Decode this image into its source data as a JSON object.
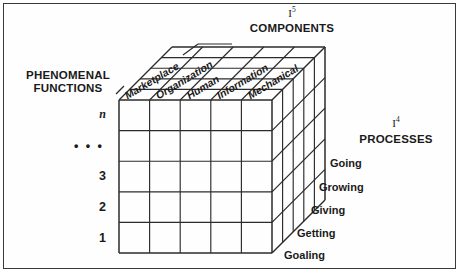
{
  "diagram": {
    "title_components": "COMPONENTS",
    "title_processes": "PROCESSES",
    "title_functions_line1": "PHENOMENAL",
    "title_functions_line2": "FUNCTIONS",
    "index_components": "I",
    "index_components_sup": "5",
    "index_processes": "I",
    "index_processes_sup": "4",
    "components": [
      "Marketplace",
      "Organization",
      "Human",
      "Information",
      "Mechanical"
    ],
    "processes": [
      "Going",
      "Growing",
      "Giving",
      "Getting",
      "Goaling"
    ],
    "functions": [
      "n",
      "• • •",
      "3",
      "2",
      "1"
    ],
    "colors": {
      "line": "#2b2b2b",
      "text": "#1a1a1a",
      "background": "#ffffff",
      "border": "#3a3a3a"
    },
    "grid": {
      "columns": 5,
      "rows": 5,
      "depth": 5
    }
  }
}
